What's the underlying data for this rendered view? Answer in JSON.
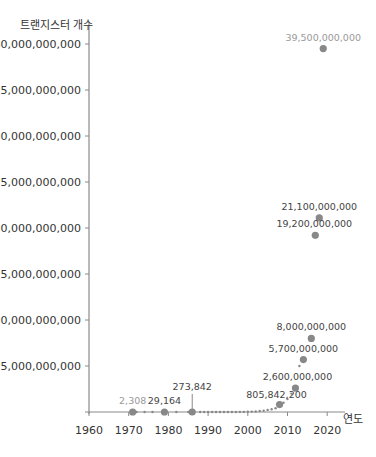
{
  "chart_data": {
    "type": "scatter",
    "title": "",
    "xlabel": "연도",
    "ylabel": "트랜지스터 개수",
    "xlim": [
      1960,
      2025
    ],
    "ylim": [
      0,
      40000000000
    ],
    "x_ticks": [
      1960,
      1970,
      1980,
      1990,
      2000,
      2010,
      2020
    ],
    "x_tick_labels": [
      "1960",
      "1970",
      "1980",
      "1990",
      "2000",
      "2010",
      "2020"
    ],
    "y_ticks": [
      5000000000,
      10000000000,
      15000000000,
      20000000000,
      25000000000,
      30000000000,
      35000000000,
      40000000000
    ],
    "y_tick_labels": [
      "5,000,000,000",
      "10,000,000,000",
      "15,000,000,000",
      "20,000,000,000",
      "25,000,000,000",
      "30,000,000,000",
      "35,000,000,000",
      "40,000,000,000"
    ],
    "grid": false,
    "legend": null,
    "labeled_points": [
      {
        "x": 1971,
        "y": 2308,
        "label": "2,308",
        "label_color": "#999999"
      },
      {
        "x": 1979,
        "y": 29164,
        "label": "29,164",
        "label_color": "#444444"
      },
      {
        "x": 1986,
        "y": 273842,
        "label": "273,842",
        "label_color": "#444444",
        "leader_line": true
      },
      {
        "x": 2008,
        "y": 805842200,
        "label": "805,842,200",
        "label_color": "#444444"
      },
      {
        "x": 2012,
        "y": 2600000000,
        "label": "2,600,000,000",
        "label_color": "#444444"
      },
      {
        "x": 2014,
        "y": 5700000000,
        "label": "5,700,000,000",
        "label_color": "#444444"
      },
      {
        "x": 2016,
        "y": 8000000000,
        "label": "8,000,000,000",
        "label_color": "#444444"
      },
      {
        "x": 2017,
        "y": 19200000000,
        "label": "19,200,000,000",
        "label_color": "#444444"
      },
      {
        "x": 2018,
        "y": 21100000000,
        "label": "21,100,000,000",
        "label_color": "#444444"
      },
      {
        "x": 2019,
        "y": 39500000000,
        "label": "39,500,000,000",
        "label_color": "#999999"
      }
    ],
    "small_points_x": [
      1972,
      1974,
      1976,
      1982,
      1985,
      1988,
      1989,
      1990,
      1991,
      1992,
      1993,
      1994,
      1995,
      1996,
      1997,
      1998,
      1999,
      2000,
      2001,
      2002,
      2003,
      2004,
      2005,
      2006,
      2007,
      2009,
      2010,
      2011,
      2013
    ],
    "small_points_y": [
      3500,
      4500,
      6500,
      134000,
      275000,
      1200000,
      1200000,
      1200000,
      3100000,
      3100000,
      3100000,
      5500000,
      5500000,
      7500000,
      7500000,
      9500000,
      9500000,
      21000000,
      42000000,
      55000000,
      105000000,
      130000000,
      230000000,
      291000000,
      410000000,
      1000000000,
      1400000000,
      2000000000,
      5000000000
    ],
    "colors": {
      "point": "#888888",
      "axis": "#8a8a8a",
      "text": "#333333",
      "muted_text": "#999999"
    }
  }
}
